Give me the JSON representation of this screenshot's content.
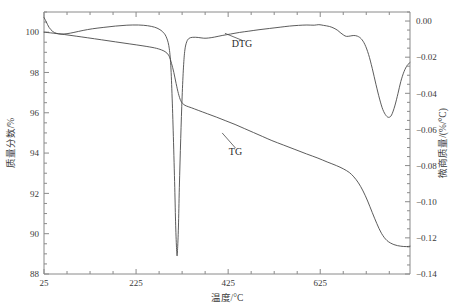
{
  "chart_data": {
    "type": "line",
    "title": "",
    "xlabel": "温度/°C",
    "ylabel": "质量分数/%",
    "y2label": "微商质量/(%/°C)",
    "xlim": [
      25,
      820
    ],
    "ylim": [
      88,
      101
    ],
    "y2lim": [
      -0.14,
      0.005
    ],
    "grid": false,
    "legend_position": "inline-annotation",
    "xticks": [
      25,
      225,
      425,
      625
    ],
    "xticklabels": [
      "25",
      "225",
      "425",
      "625"
    ],
    "yticks": [
      88,
      90,
      92,
      94,
      96,
      98,
      100
    ],
    "yticklabels": [
      "88",
      "90",
      "92",
      "94",
      "96",
      "98",
      "100"
    ],
    "y2ticks": [
      0.0,
      -0.02,
      -0.04,
      -0.06,
      -0.08,
      -0.1,
      -0.12,
      -0.14
    ],
    "y2ticklabels": [
      "0.00",
      "−0.02",
      "−0.04",
      "−0.06",
      "−0.08",
      "−0.10",
      "−0.12",
      "−0.14"
    ],
    "x_minor_interval": 50,
    "y_minor_interval": 0.5,
    "y2_minor_interval": 0.005,
    "annotations": [
      {
        "text": "DTG",
        "x": 455,
        "y": -0.0145,
        "leader_to_x": 418,
        "leader_to_y": -0.0068
      },
      {
        "text": "TG",
        "x": 441,
        "y": 93.9,
        "leader_to_x": 412,
        "leader_to_y": 95.0
      }
    ],
    "series": [
      {
        "name": "TG",
        "axis": "left",
        "units": "%",
        "color": "#4a4a4a",
        "points": [
          [
            25,
            100.0
          ],
          [
            45,
            99.95
          ],
          [
            70,
            99.88
          ],
          [
            95,
            99.8
          ],
          [
            120,
            99.72
          ],
          [
            150,
            99.62
          ],
          [
            180,
            99.52
          ],
          [
            210,
            99.42
          ],
          [
            240,
            99.32
          ],
          [
            265,
            99.22
          ],
          [
            280,
            99.12
          ],
          [
            290,
            99.0
          ],
          [
            297,
            98.8
          ],
          [
            302,
            98.45
          ],
          [
            307,
            98.0
          ],
          [
            312,
            97.45
          ],
          [
            317,
            96.95
          ],
          [
            322,
            96.6
          ],
          [
            328,
            96.42
          ],
          [
            335,
            96.33
          ],
          [
            345,
            96.25
          ],
          [
            360,
            96.12
          ],
          [
            380,
            95.95
          ],
          [
            400,
            95.78
          ],
          [
            420,
            95.6
          ],
          [
            440,
            95.42
          ],
          [
            460,
            95.22
          ],
          [
            480,
            95.02
          ],
          [
            500,
            94.82
          ],
          [
            520,
            94.62
          ],
          [
            545,
            94.4
          ],
          [
            570,
            94.18
          ],
          [
            595,
            93.96
          ],
          [
            620,
            93.75
          ],
          [
            640,
            93.56
          ],
          [
            660,
            93.38
          ],
          [
            675,
            93.22
          ],
          [
            688,
            93.04
          ],
          [
            698,
            92.82
          ],
          [
            708,
            92.52
          ],
          [
            718,
            92.12
          ],
          [
            728,
            91.62
          ],
          [
            738,
            91.05
          ],
          [
            748,
            90.5
          ],
          [
            758,
            90.02
          ],
          [
            770,
            89.66
          ],
          [
            785,
            89.46
          ],
          [
            800,
            89.38
          ],
          [
            812,
            89.36
          ],
          [
            820,
            89.38
          ]
        ]
      },
      {
        "name": "DTG",
        "axis": "right",
        "units": "%/°C",
        "color": "#4a4a4a",
        "points": [
          [
            25,
            0.002
          ],
          [
            30,
            -0.0005
          ],
          [
            36,
            -0.0035
          ],
          [
            44,
            -0.0058
          ],
          [
            52,
            -0.0068
          ],
          [
            62,
            -0.0072
          ],
          [
            75,
            -0.007
          ],
          [
            90,
            -0.0063
          ],
          [
            110,
            -0.0052
          ],
          [
            130,
            -0.0043
          ],
          [
            155,
            -0.0035
          ],
          [
            180,
            -0.0028
          ],
          [
            205,
            -0.0023
          ],
          [
            230,
            -0.0022
          ],
          [
            250,
            -0.0026
          ],
          [
            265,
            -0.0034
          ],
          [
            275,
            -0.0045
          ],
          [
            283,
            -0.006
          ],
          [
            290,
            -0.0085
          ],
          [
            296,
            -0.0135
          ],
          [
            300,
            -0.023
          ],
          [
            303,
            -0.04
          ],
          [
            306,
            -0.064
          ],
          [
            309,
            -0.092
          ],
          [
            311,
            -0.113
          ],
          [
            313,
            -0.1265
          ],
          [
            314,
            -0.13
          ],
          [
            315,
            -0.127
          ],
          [
            317,
            -0.114
          ],
          [
            319,
            -0.092
          ],
          [
            322,
            -0.065
          ],
          [
            325,
            -0.042
          ],
          [
            328,
            -0.0255
          ],
          [
            331,
            -0.016
          ],
          [
            335,
            -0.0115
          ],
          [
            340,
            -0.0096
          ],
          [
            348,
            -0.009
          ],
          [
            360,
            -0.0091
          ],
          [
            372,
            -0.0095
          ],
          [
            382,
            -0.0094
          ],
          [
            395,
            -0.0089
          ],
          [
            412,
            -0.008
          ],
          [
            430,
            -0.0072
          ],
          [
            450,
            -0.0063
          ],
          [
            470,
            -0.0056
          ],
          [
            492,
            -0.0048
          ],
          [
            515,
            -0.0041
          ],
          [
            538,
            -0.0034
          ],
          [
            558,
            -0.0028
          ],
          [
            578,
            -0.0024
          ],
          [
            596,
            -0.0022
          ],
          [
            612,
            -0.0023
          ],
          [
            622,
            -0.002
          ],
          [
            632,
            -0.0024
          ],
          [
            645,
            -0.003
          ],
          [
            655,
            -0.004
          ],
          [
            663,
            -0.0052
          ],
          [
            670,
            -0.0067
          ],
          [
            676,
            -0.0078
          ],
          [
            682,
            -0.0085
          ],
          [
            690,
            -0.0083
          ],
          [
            698,
            -0.008
          ],
          [
            706,
            -0.0084
          ],
          [
            714,
            -0.0098
          ],
          [
            722,
            -0.013
          ],
          [
            730,
            -0.0185
          ],
          [
            738,
            -0.0262
          ],
          [
            746,
            -0.035
          ],
          [
            754,
            -0.0432
          ],
          [
            761,
            -0.049
          ],
          [
            768,
            -0.0523
          ],
          [
            774,
            -0.0533
          ],
          [
            780,
            -0.052
          ],
          [
            787,
            -0.047
          ],
          [
            794,
            -0.04
          ],
          [
            800,
            -0.0335
          ],
          [
            807,
            -0.028
          ],
          [
            814,
            -0.0245
          ],
          [
            820,
            -0.023
          ]
        ]
      }
    ]
  }
}
